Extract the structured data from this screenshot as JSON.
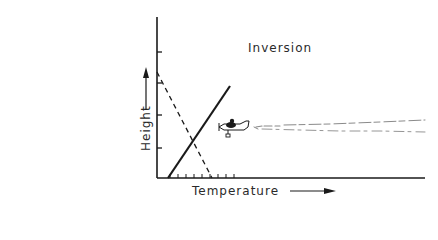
{
  "diagram": {
    "title": "Inversion",
    "x_axis_label": "Temperature",
    "y_axis_label": "Height",
    "lines": [
      {
        "name": "environmental-lapse-rate",
        "style": "solid",
        "description": "temperature increasing with height (inversion)"
      },
      {
        "name": "adiabatic-lapse-rate",
        "style": "dashed",
        "description": "temperature decreasing with height"
      }
    ],
    "annotations": [
      {
        "name": "airplane",
        "description": "aircraft flying left, trailing a plume"
      },
      {
        "name": "exhaust-plume",
        "description": "horizontal smoke trail trapped under inversion"
      }
    ],
    "colors": {
      "ink": "#1a1a1a",
      "background": "#ffffff",
      "plume": "#8a8a8a"
    }
  }
}
